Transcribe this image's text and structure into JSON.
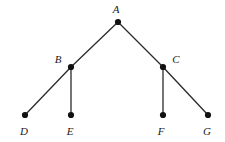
{
  "figure": {
    "background_color": "#ffffff",
    "edge_color": "#2b2b2b",
    "node_color": "#111111",
    "label_color": "#1a1a1a",
    "node_radius": 3.1,
    "edge_width": 1.3,
    "width": 225,
    "height": 142
  },
  "chart_data": {
    "type": "diagram",
    "subtype": "tree-graph",
    "title": "",
    "nodes": [
      {
        "id": "A",
        "label": "A",
        "x": 118,
        "y": 22,
        "label_x": 116,
        "label_y": 9,
        "level": 0,
        "role": "root"
      },
      {
        "id": "B",
        "label": "B",
        "x": 71,
        "y": 67,
        "label_x": 58,
        "label_y": 59,
        "level": 1,
        "role": "internal"
      },
      {
        "id": "C",
        "label": "C",
        "x": 163,
        "y": 67,
        "label_x": 176,
        "label_y": 59,
        "level": 1,
        "role": "internal"
      },
      {
        "id": "D",
        "label": "D",
        "x": 25,
        "y": 115,
        "label_x": 24,
        "label_y": 131,
        "level": 2,
        "role": "leaf"
      },
      {
        "id": "E",
        "label": "E",
        "x": 71,
        "y": 115,
        "label_x": 70,
        "label_y": 131,
        "level": 2,
        "role": "leaf"
      },
      {
        "id": "F",
        "label": "F",
        "x": 163,
        "y": 115,
        "label_x": 161,
        "label_y": 131,
        "level": 2,
        "role": "leaf"
      },
      {
        "id": "G",
        "label": "G",
        "x": 208,
        "y": 115,
        "label_x": 207,
        "label_y": 131,
        "level": 2,
        "role": "leaf"
      }
    ],
    "edges": [
      {
        "from": "A",
        "to": "B",
        "x1": 118,
        "y1": 22,
        "x2": 71,
        "y2": 67
      },
      {
        "from": "A",
        "to": "C",
        "x1": 118,
        "y1": 22,
        "x2": 163,
        "y2": 67
      },
      {
        "from": "B",
        "to": "D",
        "x1": 71,
        "y1": 67,
        "x2": 25,
        "y2": 115
      },
      {
        "from": "B",
        "to": "E",
        "x1": 71,
        "y1": 67,
        "x2": 71,
        "y2": 115
      },
      {
        "from": "C",
        "to": "F",
        "x1": 163,
        "y1": 67,
        "x2": 163,
        "y2": 115
      },
      {
        "from": "C",
        "to": "G",
        "x1": 163,
        "y1": 67,
        "x2": 208,
        "y2": 115
      }
    ]
  }
}
